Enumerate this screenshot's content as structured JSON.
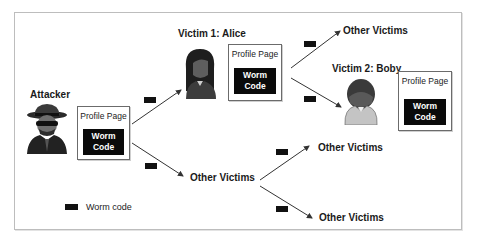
{
  "diagram": {
    "attacker": {
      "label": "Attacker",
      "profile": {
        "title": "Profile Page",
        "worm_line1": "Worm",
        "worm_line2": "Code"
      }
    },
    "victim1": {
      "label": "Victim 1: Alice",
      "profile": {
        "title": "Profile Page",
        "worm_line1": "Worm",
        "worm_line2": "Code"
      }
    },
    "victim2": {
      "label": "Victim 2: Boby",
      "profile": {
        "title": "Profile Page",
        "worm_line1": "Worm",
        "worm_line2": "Code"
      }
    },
    "other_victims": {
      "from_alice": "Other Victims",
      "from_attacker": "Other Victims",
      "branch_top": "Other Victims",
      "branch_bottom": "Other Victims"
    },
    "legend": {
      "label": "Worm code"
    },
    "colors": {
      "worm_box": "#0a0a0a",
      "frame": "#bdbdbd",
      "arrow": "#333333"
    }
  }
}
